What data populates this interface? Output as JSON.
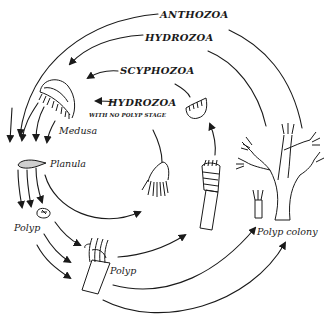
{
  "diagram": {
    "groups": [
      {
        "id": "anthozoa",
        "label": "ANTHOZOA",
        "path": [
          "Planula",
          "Polyp",
          "Polyp colony"
        ]
      },
      {
        "id": "hydrozoa",
        "label": "HYDROZOA",
        "path": [
          "Polyp colony",
          "Medusa",
          "Planula",
          "Polyp"
        ]
      },
      {
        "id": "scyphozoa",
        "label": "SCYPHOZOA",
        "path": [
          "Polyp",
          "Strobila",
          "Ephyra",
          "Medusa"
        ]
      },
      {
        "id": "hydrozoa-no-polyp",
        "label": "HYDROZOA",
        "sublabel": "WITH NO POLYP STAGE",
        "path": [
          "Planula",
          "Actinula",
          "Medusa"
        ]
      }
    ],
    "stages": {
      "medusa": "Medusa",
      "planula": "Planula",
      "polyp_small": "Polyp",
      "polyp_large": "Polyp",
      "polyp_colony": "Polyp colony"
    },
    "colors": {
      "ink": "#1a1a1a",
      "background": "#ffffff"
    }
  }
}
